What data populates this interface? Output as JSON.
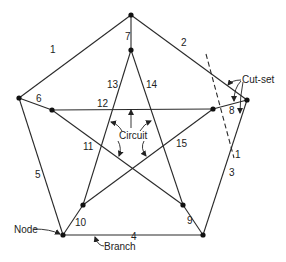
{
  "colors": {
    "line": "#2a2a2a",
    "node": "#111111",
    "background": "#ffffff"
  },
  "nodes": [
    {
      "id": "A",
      "x": 131,
      "y": 15
    },
    {
      "id": "B",
      "x": 19,
      "y": 98
    },
    {
      "id": "C",
      "x": 247,
      "y": 100
    },
    {
      "id": "D",
      "x": 63,
      "y": 235
    },
    {
      "id": "E",
      "x": 203,
      "y": 235
    },
    {
      "id": "a",
      "x": 131,
      "y": 50
    },
    {
      "id": "b",
      "x": 52,
      "y": 110
    },
    {
      "id": "c",
      "x": 213,
      "y": 109
    },
    {
      "id": "d",
      "x": 83,
      "y": 205
    },
    {
      "id": "e",
      "x": 183,
      "y": 205
    }
  ],
  "branches": [
    {
      "label": "1",
      "from": "A",
      "to": "B",
      "lx": 50,
      "ly": 53
    },
    {
      "label": "2",
      "from": "A",
      "to": "C",
      "lx": 181,
      "ly": 46
    },
    {
      "label": "3",
      "from": "C",
      "to": "E",
      "lx": 229,
      "ly": 176
    },
    {
      "label": "4",
      "from": "D",
      "to": "E",
      "lx": 131,
      "ly": 240
    },
    {
      "label": "5",
      "from": "B",
      "to": "D",
      "lx": 35,
      "ly": 178
    },
    {
      "label": "6",
      "from": "B",
      "to": "b",
      "lx": 36,
      "ly": 102
    },
    {
      "label": "7",
      "from": "A",
      "to": "a",
      "lx": 125,
      "ly": 40
    },
    {
      "label": "8",
      "from": "C",
      "to": "c",
      "lx": 229,
      "ly": 114
    },
    {
      "label": "9",
      "from": "E",
      "to": "e",
      "lx": 187,
      "ly": 224
    },
    {
      "label": "10",
      "from": "D",
      "to": "d",
      "lx": 75,
      "ly": 226
    },
    {
      "label": "11",
      "from": "b",
      "to": "e",
      "lx": 83,
      "ly": 150
    },
    {
      "label": "12",
      "from": "b",
      "to": "c",
      "lx": 97,
      "ly": 107
    },
    {
      "label": "13",
      "from": "a",
      "to": "d",
      "lx": 107,
      "ly": 88
    },
    {
      "label": "14",
      "from": "a",
      "to": "e",
      "lx": 146,
      "ly": 88
    },
    {
      "label": "15",
      "from": "c",
      "to": "d",
      "lx": 176,
      "ly": 147
    }
  ],
  "annotations": {
    "circuit": "Circuit",
    "cut_set": "Cut-set",
    "node": "Node",
    "branch": "Branch",
    "cut_line_label": "1"
  }
}
